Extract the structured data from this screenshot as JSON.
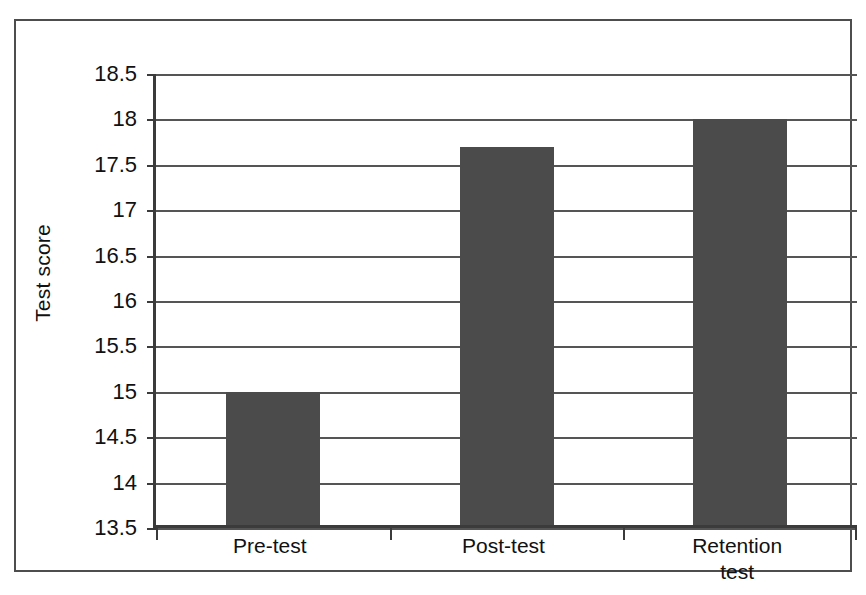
{
  "figure": {
    "y_axis_title": "Test score",
    "frame_color": "#4d4d4d",
    "bar_color": "#4b4b4b",
    "gridline_color": "#555555"
  },
  "chart_data": {
    "type": "bar",
    "title": "",
    "xlabel": "",
    "ylabel": "Test score",
    "categories": [
      "Pre-test",
      "Post-test",
      "Retention\ntest"
    ],
    "category_labels": [
      {
        "line1": "Pre-test",
        "line2": ""
      },
      {
        "line1": "Post-test",
        "line2": ""
      },
      {
        "line1": "Retention",
        "line2": "test"
      }
    ],
    "values": [
      15,
      17.7,
      18
    ],
    "ylim": [
      13.5,
      18.5
    ],
    "ytick_step": 0.5,
    "yticks": [
      18.5,
      18,
      17.5,
      17,
      16.5,
      16,
      15.5,
      15,
      14.5,
      14,
      13.5
    ],
    "ytick_labels": [
      "18.5",
      "18",
      "17.5",
      "17",
      "16.5",
      "16",
      "15.5",
      "15",
      "14.5",
      "14",
      "13.5"
    ],
    "grid": true,
    "legend": false,
    "legend_position": "none"
  }
}
